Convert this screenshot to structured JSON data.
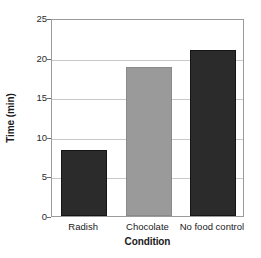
{
  "chart_data": {
    "type": "bar",
    "title": "",
    "xlabel": "Condition",
    "ylabel": "Time (min)",
    "categories": [
      "Radish",
      "Chocolate",
      "No food control"
    ],
    "values": [
      8.3,
      18.8,
      21.0
    ],
    "ylim": [
      0,
      25
    ],
    "ytick_labels": [
      "0",
      "5",
      "10",
      "15",
      "20",
      "25"
    ],
    "ytick_values": [
      0,
      5,
      10,
      15,
      20,
      25
    ],
    "grid": true,
    "gridlines_at": [
      5,
      10,
      15,
      20
    ],
    "legend": "none",
    "bar_colors": [
      "#2b2b2b",
      "#9a9a9a",
      "#2b2b2b"
    ],
    "frame_color": "#9b9b9b",
    "gridline_color": "#c9c9c9",
    "background_color": "#ffffff"
  }
}
